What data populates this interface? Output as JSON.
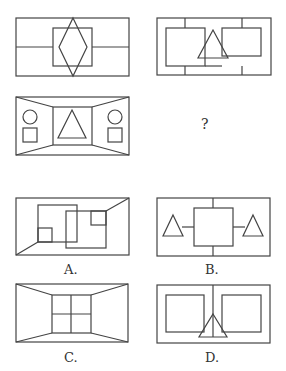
{
  "question": {
    "top_fragment": "'",
    "missing_marker": "?",
    "figures": [
      {
        "id": "fig-1",
        "description": "rectangle with horizontal midline, central square, diamond"
      },
      {
        "id": "fig-2",
        "description": "rectangle with two squares, triangle between, vertical ticks"
      },
      {
        "id": "fig-3",
        "description": "room perspective with central square containing triangle, circles and squares on sides"
      }
    ]
  },
  "options": [
    {
      "label": "A.",
      "id": "option-a"
    },
    {
      "label": "B.",
      "id": "option-b"
    },
    {
      "label": "C.",
      "id": "option-c"
    },
    {
      "label": "D.",
      "id": "option-d"
    }
  ],
  "colors": {
    "stroke": "#444444",
    "background": "#ffffff"
  }
}
